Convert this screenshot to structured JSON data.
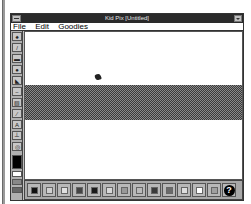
{
  "window": {
    "title": "Kid Pix [Untitled]",
    "maximize_icon": "maximize-arrow-icon",
    "system_menu_icon": "system-menu-icon"
  },
  "menu": {
    "items": [
      {
        "label": "File"
      },
      {
        "label": "Edit"
      },
      {
        "label": "Goodies"
      }
    ]
  },
  "toolbar": {
    "tools": [
      {
        "name": "wacky-brush-tool",
        "glyph": "♠"
      },
      {
        "name": "pencil-tool",
        "glyph": "/"
      },
      {
        "name": "rectangle-tool",
        "glyph": "▬"
      },
      {
        "name": "oval-tool",
        "glyph": "●"
      },
      {
        "name": "paint-bucket-tool",
        "glyph": "◣"
      },
      {
        "name": "line-tool",
        "glyph": "−"
      },
      {
        "name": "eraser-tool",
        "glyph": "▧"
      },
      {
        "name": "moving-van-tool",
        "glyph": "∕"
      },
      {
        "name": "text-tool",
        "glyph": "A"
      },
      {
        "name": "stamp-tool",
        "glyph": "┴"
      },
      {
        "name": "undo-guy-tool",
        "glyph": "◎"
      },
      {
        "name": "color-selector",
        "glyph": ""
      }
    ]
  },
  "palette": {
    "swatches": [
      {
        "fill": "#111111"
      },
      {
        "fill": "#d0d0d0"
      },
      {
        "fill": "#e0e0e0"
      },
      {
        "fill": "#444444"
      },
      {
        "fill": "#1a1a1a"
      },
      {
        "fill": "#d8d8d8"
      },
      {
        "fill": "#999999"
      },
      {
        "fill": "#bbbbbb"
      },
      {
        "fill": "#3a3a3a"
      },
      {
        "fill": "#6a6a6a"
      },
      {
        "fill": "#dddddd"
      },
      {
        "fill": "#ffffff"
      },
      {
        "fill": "#a0a0a0"
      }
    ],
    "help_label": "?"
  },
  "colors": {
    "titlebar": "#2a2a2a",
    "chrome": "#c0c0c0",
    "canvas": "#ffffff",
    "pattern_dark": "#3a3a3a",
    "pattern_light": "#8a8a8a"
  }
}
